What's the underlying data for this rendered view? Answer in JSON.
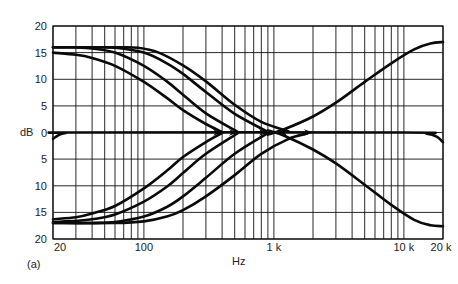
{
  "chart_data": {
    "type": "line",
    "title": "",
    "panel_label": "(a)",
    "xlabel": "Hz",
    "ylabel": "dB",
    "xscale": "log",
    "xlim": [
      20,
      20000
    ],
    "ylim": [
      -20,
      20
    ],
    "grid": true,
    "x_tick_labels": [
      {
        "value": 20,
        "label": "20"
      },
      {
        "value": 100,
        "label": "100"
      },
      {
        "value": 1000,
        "label": "1 k"
      },
      {
        "value": 10000,
        "label": "10 k"
      },
      {
        "value": 20000,
        "label": "20 k"
      }
    ],
    "y_tick_labels": [
      {
        "value": 20,
        "label": "20"
      },
      {
        "value": 15,
        "label": "15"
      },
      {
        "value": 10,
        "label": "10"
      },
      {
        "value": 5,
        "label": "5"
      },
      {
        "value": 0,
        "label": "0"
      },
      {
        "value": -5,
        "label": "5"
      },
      {
        "value": -10,
        "label": "10"
      },
      {
        "value": -15,
        "label": "15"
      },
      {
        "value": -20,
        "label": "20"
      }
    ],
    "x_gridlines": [
      20,
      30,
      40,
      50,
      60,
      70,
      80,
      90,
      100,
      200,
      300,
      400,
      500,
      600,
      700,
      800,
      900,
      1000,
      2000,
      3000,
      4000,
      5000,
      6000,
      7000,
      8000,
      9000,
      10000,
      20000
    ],
    "y_gridlines": [
      20,
      15,
      10,
      5,
      0,
      -5,
      -10,
      -15,
      -20
    ],
    "series": [
      {
        "name": "flat",
        "points": [
          [
            20,
            -1.2
          ],
          [
            22,
            -0.5
          ],
          [
            25,
            -0.1
          ],
          [
            30,
            0
          ],
          [
            10000,
            0
          ],
          [
            15000,
            -0.2
          ],
          [
            18000,
            -0.8
          ],
          [
            20000,
            -1.8
          ]
        ]
      },
      {
        "name": "bass boost, turnover 400 Hz",
        "points": [
          [
            20,
            15
          ],
          [
            30,
            14.6
          ],
          [
            40,
            14
          ],
          [
            60,
            12.5
          ],
          [
            100,
            9.5
          ],
          [
            150,
            6.5
          ],
          [
            200,
            4.2
          ],
          [
            300,
            1.6
          ],
          [
            400,
            0.1
          ]
        ]
      },
      {
        "name": "bass boost, turnover 530 Hz",
        "points": [
          [
            20,
            16
          ],
          [
            30,
            16
          ],
          [
            40,
            15.8
          ],
          [
            60,
            15
          ],
          [
            100,
            12.5
          ],
          [
            150,
            9.6
          ],
          [
            200,
            7.1
          ],
          [
            300,
            3.6
          ],
          [
            530,
            0.1
          ]
        ]
      },
      {
        "name": "bass boost, turnover 900 Hz",
        "points": [
          [
            20,
            16
          ],
          [
            40,
            16
          ],
          [
            60,
            15.9
          ],
          [
            100,
            15
          ],
          [
            150,
            13
          ],
          [
            200,
            11
          ],
          [
            300,
            7.6
          ],
          [
            500,
            3.5
          ],
          [
            900,
            0.1
          ]
        ]
      },
      {
        "name": "bass boost, turnover 1.3 kHz",
        "points": [
          [
            20,
            16
          ],
          [
            60,
            16
          ],
          [
            90,
            15.9
          ],
          [
            130,
            15
          ],
          [
            200,
            12.6
          ],
          [
            300,
            9.6
          ],
          [
            500,
            5.2
          ],
          [
            800,
            2
          ],
          [
            1300,
            0.2
          ]
        ]
      },
      {
        "name": "bass cut, turnover 400 Hz",
        "points": [
          [
            20,
            -16.3
          ],
          [
            30,
            -15.9
          ],
          [
            40,
            -15.2
          ],
          [
            60,
            -13.8
          ],
          [
            100,
            -10.5
          ],
          [
            150,
            -7.2
          ],
          [
            200,
            -4.6
          ],
          [
            300,
            -1.8
          ],
          [
            400,
            -0.1
          ]
        ]
      },
      {
        "name": "bass cut, turnover 530 Hz",
        "points": [
          [
            20,
            -16.8
          ],
          [
            30,
            -16.6
          ],
          [
            40,
            -16.3
          ],
          [
            60,
            -15.4
          ],
          [
            100,
            -13
          ],
          [
            150,
            -10.2
          ],
          [
            200,
            -7.6
          ],
          [
            300,
            -4
          ],
          [
            530,
            -0.1
          ]
        ]
      },
      {
        "name": "bass cut, turnover 900 Hz",
        "points": [
          [
            20,
            -17
          ],
          [
            40,
            -17
          ],
          [
            60,
            -16.8
          ],
          [
            100,
            -15.8
          ],
          [
            150,
            -14
          ],
          [
            200,
            -12
          ],
          [
            300,
            -8.5
          ],
          [
            500,
            -4
          ],
          [
            900,
            -0.1
          ]
        ]
      },
      {
        "name": "bass cut, turnover 1.3 kHz",
        "points": [
          [
            20,
            -17
          ],
          [
            60,
            -17
          ],
          [
            100,
            -16.7
          ],
          [
            150,
            -15.8
          ],
          [
            200,
            -14.6
          ],
          [
            300,
            -12
          ],
          [
            500,
            -8
          ],
          [
            800,
            -4
          ],
          [
            1300,
            -1.2
          ],
          [
            1800,
            -0.2
          ]
        ]
      },
      {
        "name": "treble boost",
        "points": [
          [
            900,
            -0.4
          ],
          [
            1200,
            0.6
          ],
          [
            2000,
            3
          ],
          [
            3000,
            5.6
          ],
          [
            5000,
            9.5
          ],
          [
            8000,
            13
          ],
          [
            12000,
            15.6
          ],
          [
            16000,
            16.7
          ],
          [
            20000,
            17
          ]
        ]
      },
      {
        "name": "treble cut",
        "points": [
          [
            900,
            0.4
          ],
          [
            1200,
            -0.6
          ],
          [
            2000,
            -3.2
          ],
          [
            3000,
            -5.8
          ],
          [
            5000,
            -9.8
          ],
          [
            8000,
            -13.6
          ],
          [
            12000,
            -16.4
          ],
          [
            16000,
            -17.4
          ],
          [
            20000,
            -17.6
          ]
        ]
      }
    ],
    "arrows": [
      {
        "x": 400,
        "y": 0,
        "direction": "right"
      },
      {
        "x": 530,
        "y": 0,
        "direction": "right"
      },
      {
        "x": 900,
        "y": 0,
        "direction": "right"
      },
      {
        "x": 1080,
        "y": 0,
        "direction": "left"
      },
      {
        "x": 2000,
        "y": 0,
        "direction": "right"
      }
    ]
  }
}
